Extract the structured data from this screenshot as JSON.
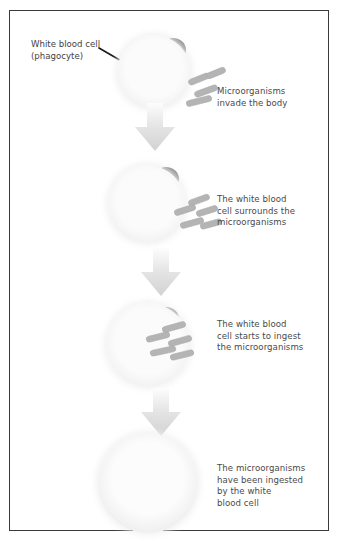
{
  "figure": {
    "frame_color": "#3a3a3a",
    "background": "#ffffff"
  },
  "colors": {
    "cell_body": "#7b7b7b",
    "cell_body_dark": "#6f6f6f",
    "cell_body_light": "#8a8a8a",
    "microorganism": "#b4b4b4",
    "microorganism_edge": "#a2a2a2",
    "halo": "#f4f4f4",
    "arrow": "#dcdcdc",
    "text": "#4a4a4a",
    "callout_arrow": "#1b1b1b"
  },
  "callout": {
    "label": "White blood cell\n(phagocyte)",
    "arrow_name": "pointer-arrow"
  },
  "stages": [
    {
      "id": "stage-1",
      "caption": "Microorganisms\ninvade the body",
      "cell_name": "white-blood-cell",
      "microorganism_count": 4,
      "microorganisms_ingested": false
    },
    {
      "id": "stage-2",
      "caption": "The white blood\ncell surrounds the\nmicroorganisms",
      "cell_name": "white-blood-cell",
      "microorganism_count": 5,
      "microorganisms_ingested": false
    },
    {
      "id": "stage-3",
      "caption": "The white blood\ncell starts to ingest\nthe microorganisms",
      "cell_name": "white-blood-cell",
      "microorganism_count": 5,
      "microorganisms_ingested": false
    },
    {
      "id": "stage-4",
      "caption": "The microorganisms\nhave been ingested\nby the white\nblood cell",
      "cell_name": "white-blood-cell",
      "microorganism_count": 0,
      "microorganisms_ingested": true
    }
  ],
  "arrows": [
    {
      "id": "flow-arrow-1",
      "name": "down-arrow"
    },
    {
      "id": "flow-arrow-2",
      "name": "down-arrow"
    },
    {
      "id": "flow-arrow-3",
      "name": "down-arrow"
    }
  ]
}
